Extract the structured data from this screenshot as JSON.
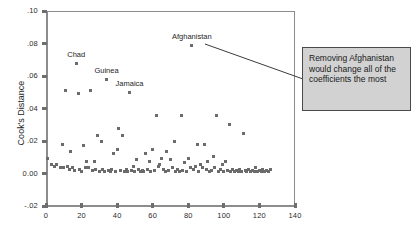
{
  "chart_data": {
    "type": "scatter",
    "title": "",
    "xlabel": "",
    "ylabel": "Cook's Distance",
    "xlim": [
      0,
      140
    ],
    "ylim": [
      -0.02,
      0.1
    ],
    "grid": false,
    "legend": null,
    "x_ticks": [
      0,
      20,
      40,
      60,
      80,
      100,
      120,
      140
    ],
    "x_tick_labels": [
      "0",
      "20",
      "40",
      "60",
      "80",
      "100",
      "120",
      "140"
    ],
    "y_ticks": [
      0.1,
      0.08,
      0.06,
      0.04,
      0.02,
      0.0,
      -0.02
    ],
    "y_tick_labels": [
      ".10",
      ".08",
      ".06",
      ".04",
      ".02",
      "0.00",
      "-.02"
    ],
    "point_color": "#6b6b6b",
    "annotations": [
      {
        "label": "Afghanistan",
        "x": 82,
        "y": 0.079
      },
      {
        "label": "Chad",
        "x": 17,
        "y": 0.068
      },
      {
        "label": "Guinea",
        "x": 34,
        "y": 0.058
      },
      {
        "label": "Jamaica",
        "x": 47,
        "y": 0.05
      }
    ],
    "points": [
      {
        "x": 82,
        "y": 0.079
      },
      {
        "x": 17,
        "y": 0.068
      },
      {
        "x": 34,
        "y": 0.058
      },
      {
        "x": 47,
        "y": 0.05
      },
      {
        "x": 11,
        "y": 0.051
      },
      {
        "x": 18,
        "y": 0.049
      },
      {
        "x": 25,
        "y": 0.051
      },
      {
        "x": 62,
        "y": 0.0355
      },
      {
        "x": 76,
        "y": 0.0355
      },
      {
        "x": 96,
        "y": 0.0355
      },
      {
        "x": 103,
        "y": 0.03
      },
      {
        "x": 41,
        "y": 0.028
      },
      {
        "x": 111,
        "y": 0.0245
      },
      {
        "x": 29,
        "y": 0.0235
      },
      {
        "x": 43,
        "y": 0.0235
      },
      {
        "x": 31,
        "y": 0.0195
      },
      {
        "x": 9,
        "y": 0.018
      },
      {
        "x": 21,
        "y": 0.0175
      },
      {
        "x": 72,
        "y": 0.0195
      },
      {
        "x": 85,
        "y": 0.018
      },
      {
        "x": 89,
        "y": 0.018
      },
      {
        "x": 14,
        "y": 0.0135
      },
      {
        "x": 38,
        "y": 0.0125
      },
      {
        "x": 40,
        "y": 0.0145
      },
      {
        "x": 56,
        "y": 0.0125
      },
      {
        "x": 60,
        "y": 0.0145
      },
      {
        "x": 68,
        "y": 0.0135
      },
      {
        "x": 1,
        "y": 0.0095
      },
      {
        "x": 23,
        "y": 0.0075
      },
      {
        "x": 27,
        "y": 0.0075
      },
      {
        "x": 51,
        "y": 0.0085
      },
      {
        "x": 58,
        "y": 0.0075
      },
      {
        "x": 65,
        "y": 0.0095
      },
      {
        "x": 70,
        "y": 0.0085
      },
      {
        "x": 78,
        "y": 0.0065
      },
      {
        "x": 80,
        "y": 0.0095
      },
      {
        "x": 91,
        "y": 0.0075
      },
      {
        "x": 94,
        "y": 0.0105
      },
      {
        "x": 99,
        "y": 0.0055
      },
      {
        "x": 101,
        "y": 0.0075
      },
      {
        "x": 3,
        "y": 0.0055
      },
      {
        "x": 5,
        "y": 0.0045
      },
      {
        "x": 6,
        "y": 0.0055
      },
      {
        "x": 8,
        "y": 0.0035
      },
      {
        "x": 10,
        "y": 0.004
      },
      {
        "x": 12,
        "y": 0.0045
      },
      {
        "x": 13,
        "y": 0.0025
      },
      {
        "x": 15,
        "y": 0.0035
      },
      {
        "x": 16,
        "y": 0.002
      },
      {
        "x": 19,
        "y": 0.0025
      },
      {
        "x": 20,
        "y": 0.0015
      },
      {
        "x": 22,
        "y": 0.004
      },
      {
        "x": 24,
        "y": 0.0035
      },
      {
        "x": 26,
        "y": 0.002
      },
      {
        "x": 28,
        "y": 0.0025
      },
      {
        "x": 30,
        "y": 0.0015
      },
      {
        "x": 32,
        "y": 0.0025
      },
      {
        "x": 33,
        "y": 0.0015
      },
      {
        "x": 35,
        "y": 0.002
      },
      {
        "x": 36,
        "y": 0.0015
      },
      {
        "x": 37,
        "y": 0.0025
      },
      {
        "x": 39,
        "y": 0.0015
      },
      {
        "x": 42,
        "y": 0.002
      },
      {
        "x": 44,
        "y": 0.0015
      },
      {
        "x": 45,
        "y": 0.0025
      },
      {
        "x": 46,
        "y": 0.0015
      },
      {
        "x": 48,
        "y": 0.002
      },
      {
        "x": 49,
        "y": 0.0045
      },
      {
        "x": 50,
        "y": 0.0015
      },
      {
        "x": 52,
        "y": 0.0025
      },
      {
        "x": 53,
        "y": 0.0015
      },
      {
        "x": 54,
        "y": 0.002
      },
      {
        "x": 55,
        "y": 0.0015
      },
      {
        "x": 57,
        "y": 0.0025
      },
      {
        "x": 59,
        "y": 0.0015
      },
      {
        "x": 61,
        "y": 0.002
      },
      {
        "x": 63,
        "y": 0.0045
      },
      {
        "x": 64,
        "y": 0.0055
      },
      {
        "x": 66,
        "y": 0.0025
      },
      {
        "x": 67,
        "y": 0.0015
      },
      {
        "x": 69,
        "y": 0.002
      },
      {
        "x": 71,
        "y": 0.0035
      },
      {
        "x": 73,
        "y": 0.0015
      },
      {
        "x": 74,
        "y": 0.0025
      },
      {
        "x": 75,
        "y": 0.0015
      },
      {
        "x": 77,
        "y": 0.002
      },
      {
        "x": 79,
        "y": 0.0015
      },
      {
        "x": 81,
        "y": 0.0035
      },
      {
        "x": 83,
        "y": 0.0025
      },
      {
        "x": 84,
        "y": 0.0045
      },
      {
        "x": 86,
        "y": 0.0015
      },
      {
        "x": 87,
        "y": 0.0055
      },
      {
        "x": 88,
        "y": 0.0035
      },
      {
        "x": 90,
        "y": 0.0025
      },
      {
        "x": 92,
        "y": 0.0015
      },
      {
        "x": 93,
        "y": 0.002
      },
      {
        "x": 95,
        "y": 0.0035
      },
      {
        "x": 97,
        "y": 0.0015
      },
      {
        "x": 98,
        "y": 0.0025
      },
      {
        "x": 100,
        "y": 0.0015
      },
      {
        "x": 102,
        "y": 0.002
      },
      {
        "x": 104,
        "y": 0.0015
      },
      {
        "x": 105,
        "y": 0.0025
      },
      {
        "x": 106,
        "y": 0.0015
      },
      {
        "x": 107,
        "y": 0.002
      },
      {
        "x": 108,
        "y": 0.0015
      },
      {
        "x": 109,
        "y": 0.0025
      },
      {
        "x": 110,
        "y": 0.0015
      },
      {
        "x": 112,
        "y": 0.002
      },
      {
        "x": 113,
        "y": 0.0015
      },
      {
        "x": 114,
        "y": 0.0025
      },
      {
        "x": 115,
        "y": 0.0015
      },
      {
        "x": 116,
        "y": 0.002
      },
      {
        "x": 117,
        "y": 0.0015
      },
      {
        "x": 118,
        "y": 0.0035
      },
      {
        "x": 119,
        "y": 0.0015
      },
      {
        "x": 120,
        "y": 0.002
      },
      {
        "x": 121,
        "y": 0.0015
      },
      {
        "x": 122,
        "y": 0.0025
      },
      {
        "x": 123,
        "y": 0.0015
      },
      {
        "x": 124,
        "y": 0.002
      },
      {
        "x": 125,
        "y": 0.0015
      },
      {
        "x": 126,
        "y": 0.0025
      }
    ]
  },
  "callout": {
    "text": "Removing Afghanistan would change all of the coefficients the most",
    "fill_color": "#d2d2d2",
    "border_color": "#4a4a4a"
  }
}
